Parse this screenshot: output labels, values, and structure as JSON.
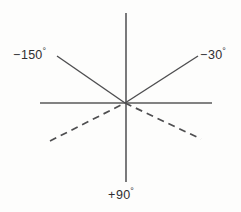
{
  "figure": {
    "name": "angle-diagram",
    "background_color": "#fdfdfc",
    "line_color": "#58585a",
    "text_color": "#2f2f31",
    "center": {
      "x": 125,
      "y": 103
    },
    "labels": {
      "upper_left": {
        "sign": "−",
        "value": "150",
        "degree": "°",
        "full": "−150°"
      },
      "upper_right": {
        "sign": "−",
        "value": "30",
        "degree": "°",
        "full": "−30°"
      },
      "bottom": {
        "sign": "+",
        "value": "90",
        "degree": "°",
        "full": "+90°"
      }
    }
  },
  "chart_data": {
    "type": "line",
    "title": "",
    "subtitle": "",
    "xlabel": "",
    "ylabel": "",
    "grid": false,
    "legend_position": "none",
    "xlim": [
      0,
      241
    ],
    "ylim": [
      0,
      212
    ],
    "origin": {
      "x": 125,
      "y": 103
    },
    "annotations": [
      {
        "text": "−150°",
        "x": 13,
        "y": 47,
        "anchor": "upper-left",
        "describes": "solid-ray-upper-left"
      },
      {
        "text": "−30°",
        "x": 200,
        "y": 47,
        "anchor": "upper-right",
        "describes": "solid-ray-upper-right"
      },
      {
        "text": "+90°",
        "x": 108,
        "y": 187,
        "anchor": "bottom-center",
        "describes": "vertical-axis-downward"
      }
    ],
    "series": [
      {
        "name": "vertical-axis",
        "style": "solid",
        "color": "#58585a",
        "x": [
          126,
          126
        ],
        "y": [
          13,
          182
        ]
      },
      {
        "name": "horizontal-axis",
        "style": "solid",
        "color": "#58585a",
        "x": [
          40,
          212
        ],
        "y": [
          103,
          103
        ]
      },
      {
        "name": "solid-diagonal-neg150-to-neg30",
        "style": "solid",
        "color": "#4e4e50",
        "x": [
          57,
          198
        ],
        "y": [
          56,
          56
        ],
        "segments": [
          {
            "name": "solid-ray-upper-left",
            "x1": 57,
            "y1": 56,
            "x2": 125,
            "y2": 103
          },
          {
            "name": "solid-ray-upper-right",
            "x1": 125,
            "y1": 103,
            "x2": 198,
            "y2": 56
          }
        ]
      },
      {
        "name": "dashed-diagonal",
        "style": "dashed",
        "color": "#4e4e50",
        "dash_pattern": [
          7,
          5
        ],
        "segments": [
          {
            "name": "dashed-ray-lower-left",
            "x1": 50,
            "y1": 141,
            "x2": 125,
            "y2": 103
          },
          {
            "name": "dashed-ray-lower-right",
            "x1": 125,
            "y1": 103,
            "x2": 201,
            "y2": 139
          }
        ]
      }
    ]
  }
}
